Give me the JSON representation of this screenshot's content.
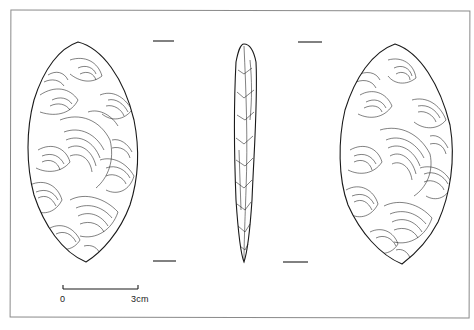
{
  "figure": {
    "views": [
      {
        "id": "face-a",
        "label": "dorsal face"
      },
      {
        "id": "profile",
        "label": "side profile"
      },
      {
        "id": "face-b",
        "label": "ventral face"
      }
    ],
    "line_color": "#1a1a1a",
    "frame_color": "#8a8a8a"
  },
  "scale_bar": {
    "start_label": "0",
    "end_label": "3cm"
  }
}
